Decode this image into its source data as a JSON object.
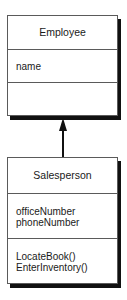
{
  "classes": [
    {
      "name": "Employee",
      "attributes": [
        "name"
      ],
      "operations": []
    },
    {
      "name": "Salesperson",
      "attributes": [
        "officeNumber",
        "phoneNumber"
      ],
      "operations": [
        "LocateBook()",
        "EnterInventory()"
      ]
    }
  ],
  "relationships": [
    {
      "type": "generalization",
      "from": "Salesperson",
      "to": "Employee"
    }
  ],
  "colors": {
    "border": "#5a5a5a",
    "shadow": "#111111",
    "line": "#111111"
  }
}
